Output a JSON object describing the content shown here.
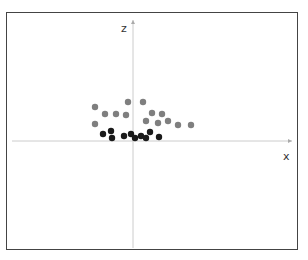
{
  "figure": {
    "caption": "",
    "axes": {
      "horizontal_label": "x",
      "vertical_label": "z",
      "origin": {
        "x": 133,
        "y": 141
      },
      "axis_color": "#cccccc"
    },
    "series": [
      {
        "name": "gray-points",
        "color": "#7f7f7f",
        "points": [
          [
            95,
            107
          ],
          [
            105,
            114
          ],
          [
            116,
            114
          ],
          [
            126,
            115
          ],
          [
            128,
            102
          ],
          [
            143,
            102
          ],
          [
            146,
            121
          ],
          [
            152,
            113
          ],
          [
            162,
            114
          ],
          [
            158,
            123
          ],
          [
            168,
            121
          ],
          [
            178,
            125
          ],
          [
            191,
            125
          ],
          [
            95,
            124
          ]
        ]
      },
      {
        "name": "black-points",
        "color": "#1a1a1a",
        "points": [
          [
            103,
            134
          ],
          [
            111,
            131
          ],
          [
            112,
            138
          ],
          [
            124,
            136
          ],
          [
            131,
            134
          ],
          [
            135,
            138
          ],
          [
            141,
            136
          ],
          [
            146,
            138
          ],
          [
            150,
            132
          ],
          [
            159,
            137
          ]
        ]
      }
    ],
    "dot_radius": 3.2
  }
}
